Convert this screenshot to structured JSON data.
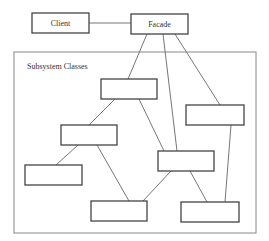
{
  "diagram": {
    "type": "facade-pattern-class-diagram",
    "nodes": [
      {
        "id": "client",
        "label": "Client",
        "x": 32,
        "y": 13,
        "w": 57,
        "h": 20
      },
      {
        "id": "facade",
        "label": "Facade",
        "x": 131,
        "y": 14,
        "w": 57,
        "h": 20
      },
      {
        "id": "sub1",
        "label": "",
        "x": 101,
        "y": 79,
        "w": 56,
        "h": 20
      },
      {
        "id": "sub2",
        "label": "",
        "x": 186,
        "y": 105,
        "w": 58,
        "h": 20
      },
      {
        "id": "sub3",
        "label": "",
        "x": 61,
        "y": 125,
        "w": 56,
        "h": 20
      },
      {
        "id": "sub4",
        "label": "",
        "x": 158,
        "y": 151,
        "w": 56,
        "h": 20
      },
      {
        "id": "sub5",
        "label": "",
        "x": 25,
        "y": 165,
        "w": 57,
        "h": 20
      },
      {
        "id": "sub6",
        "label": "",
        "x": 91,
        "y": 201,
        "w": 56,
        "h": 20
      },
      {
        "id": "sub7",
        "label": "",
        "x": 181,
        "y": 202,
        "w": 58,
        "h": 20
      }
    ],
    "group": {
      "label": "Subsystem Classes",
      "x": 14,
      "y": 52,
      "w": 242,
      "h": 181
    },
    "edges": [
      {
        "from": "client",
        "to": "facade",
        "x1": 89,
        "y1": 23,
        "x2": 131,
        "y2": 23
      },
      {
        "from": "facade",
        "to": "sub1",
        "x1": 147,
        "y1": 34,
        "x2": 128,
        "y2": 79
      },
      {
        "from": "facade",
        "to": "sub4",
        "x1": 163,
        "y1": 34,
        "x2": 177,
        "y2": 151
      },
      {
        "from": "facade",
        "to": "sub2",
        "x1": 175,
        "y1": 34,
        "x2": 220,
        "y2": 105
      },
      {
        "from": "sub1",
        "to": "sub3",
        "x1": 115,
        "y1": 99,
        "x2": 89,
        "y2": 125
      },
      {
        "from": "sub1",
        "to": "sub4",
        "x1": 139,
        "y1": 99,
        "x2": 164,
        "y2": 151
      },
      {
        "from": "sub3",
        "to": "sub5",
        "x1": 78,
        "y1": 145,
        "x2": 56,
        "y2": 165
      },
      {
        "from": "sub3",
        "to": "sub6",
        "x1": 97,
        "y1": 145,
        "x2": 129,
        "y2": 201
      },
      {
        "from": "sub4",
        "to": "sub6",
        "x1": 171,
        "y1": 171,
        "x2": 143,
        "y2": 201
      },
      {
        "from": "sub4",
        "to": "sub7",
        "x1": 190,
        "y1": 171,
        "x2": 207,
        "y2": 202
      },
      {
        "from": "sub2",
        "to": "sub7",
        "x1": 231,
        "y1": 125,
        "x2": 225,
        "y2": 202
      }
    ]
  }
}
